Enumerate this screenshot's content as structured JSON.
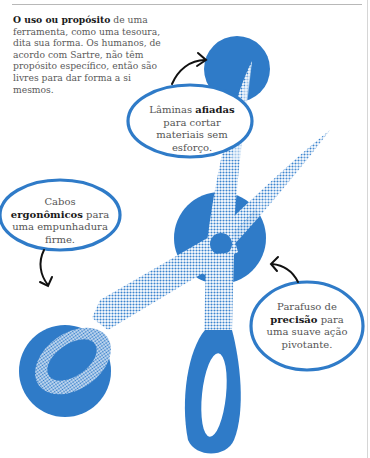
{
  "intro": {
    "bold": "O uso ou propósito",
    "rest": " de uma ferramenta, como uma tesoura, dita sua forma. Os humanos, de acordo com Sartre, não têm propósito específico, então são livres para dar forma a si mesmos."
  },
  "callouts": [
    {
      "id": "blades",
      "pre": "Lâminas ",
      "bold": "afiadas",
      "post": " para cortar materiais sem esforço."
    },
    {
      "id": "handles",
      "pre": "Cabos ",
      "bold": "ergonômicos",
      "post": " para uma empunhadura firme."
    },
    {
      "id": "screw",
      "pre": "Parafuso de ",
      "bold": "precisão",
      "post": " para uma suave ação pivotante."
    }
  ],
  "colors": {
    "accent": "#2f7bc8",
    "halftone_light": "#a9c9ec",
    "text": "#5a5a5a",
    "bold_text": "#1a1a1a"
  },
  "icons": [
    "scissors-illustration",
    "arrow-to-blade-tip",
    "arrow-to-handle",
    "arrow-to-screw"
  ]
}
